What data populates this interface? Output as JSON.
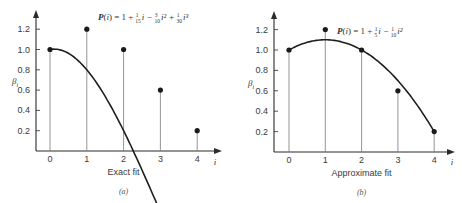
{
  "chart_data": [
    {
      "panel": "a",
      "type": "line",
      "title": "P(i) = 1 + 1/15 i − 3/10 i² + 1/30 i³",
      "formula_parts": {
        "lhs": "P(i) = 1 + ",
        "t1_num": "1",
        "t1_den": "15",
        "t1_var": "i − ",
        "t2_num": "3",
        "t2_den": "10",
        "t2_var": "i² + ",
        "t3_num": "1",
        "t3_den": "30",
        "t3_var": "i³"
      },
      "xlabel": "i",
      "ylabel": "βi",
      "caption": "Exact fit",
      "panel_label": "(a)",
      "x": [
        0,
        1,
        2,
        3,
        4
      ],
      "points": [
        1.0,
        1.2,
        1.0,
        0.6,
        0.2
      ],
      "curve": "cubic P(i) passing exactly through all points",
      "x_ticks": [
        "0",
        "1",
        "2",
        "3",
        "4"
      ],
      "y_ticks": [
        "0.2",
        "0.4",
        "0.6",
        "0.8",
        "1.0",
        "1.2"
      ],
      "ylim": [
        0,
        1.3
      ],
      "xlim": [
        -0.4,
        4.5
      ],
      "grid": false,
      "stems": true
    },
    {
      "panel": "b",
      "type": "line",
      "title": "P(i) = 1 + 1/5 i − 1/10 i²",
      "formula_parts": {
        "lhs": "P(i) = 1 + ",
        "t1_num": "1",
        "t1_den": "5",
        "t1_var": "i − ",
        "t2_num": "1",
        "t2_den": "10",
        "t2_var": "i²"
      },
      "xlabel": "i",
      "ylabel": "βi",
      "caption": "Approximate fit",
      "panel_label": "(b)",
      "x": [
        0,
        1,
        2,
        3,
        4
      ],
      "points": [
        1.0,
        1.2,
        1.0,
        0.6,
        0.2
      ],
      "curve": "quadratic P(i) approximate least-squares fit",
      "x_ticks": [
        "0",
        "1",
        "2",
        "3",
        "4"
      ],
      "y_ticks": [
        "0.2",
        "0.4",
        "0.6",
        "0.8",
        "1.0",
        "1.2"
      ],
      "ylim": [
        0,
        1.3
      ],
      "xlim": [
        -0.4,
        4.5
      ],
      "grid": false,
      "stems": true
    }
  ]
}
